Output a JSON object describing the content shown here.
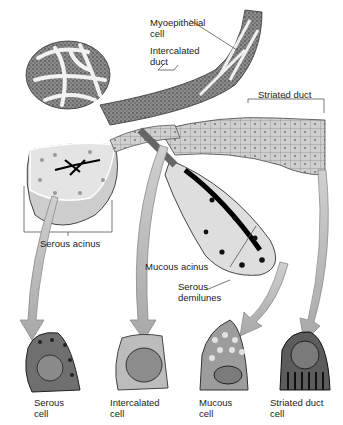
{
  "diagram": {
    "structure_labels": {
      "myoepithelial_cell": [
        "Myoepithelial",
        "cell"
      ],
      "intercalated_duct": [
        "Intercalated",
        "duct"
      ],
      "striated_duct": "Striated duct",
      "serous_acinus": "Serous acinus",
      "mucous_acinus": "Mucous acinus",
      "serous_demilunes": [
        "Serous",
        "demilunes"
      ]
    },
    "cell_types": [
      {
        "name": [
          "Serous",
          "cell"
        ]
      },
      {
        "name": [
          "Intercalated",
          "cell"
        ]
      },
      {
        "name": [
          "Mucous",
          "cell"
        ]
      },
      {
        "name": [
          "Striated duct",
          "cell"
        ]
      }
    ],
    "colors": {
      "background": "#ffffff",
      "arrow_fill": "#bdbdbd",
      "arrow_stroke": "#8a8a8a",
      "tissue_dark": "#4a4a4a",
      "tissue_mid": "#9a9a9a",
      "tissue_light": "#d6d6d6",
      "lumen": "#111111"
    }
  }
}
